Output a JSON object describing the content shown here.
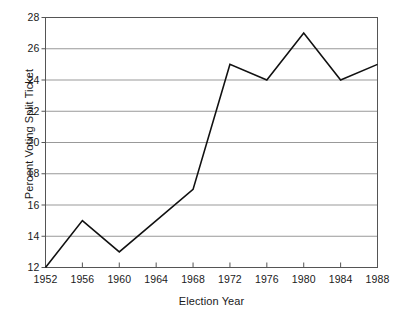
{
  "chart_data": {
    "type": "line",
    "title": "",
    "xlabel": "Election Year",
    "ylabel": "Percent Voting Split Ticket",
    "x": [
      1952,
      1956,
      1960,
      1964,
      1968,
      1972,
      1976,
      1980,
      1984,
      1988
    ],
    "values": [
      12,
      15,
      13,
      15,
      17,
      25,
      24,
      27,
      24,
      25
    ],
    "series": [
      {
        "name": "Percent Voting Split Ticket",
        "values": [
          12,
          15,
          13,
          15,
          17,
          25,
          24,
          27,
          24,
          25
        ]
      }
    ],
    "xlim": [
      1952,
      1988
    ],
    "ylim": [
      12,
      28
    ],
    "xticks": [
      1952,
      1956,
      1960,
      1964,
      1968,
      1972,
      1976,
      1980,
      1984,
      1988
    ],
    "yticks": [
      12,
      14,
      16,
      18,
      20,
      22,
      24,
      26,
      28
    ],
    "xtick_labels": [
      "1952",
      "1956",
      "1960",
      "1964",
      "1968",
      "1972",
      "1976",
      "1980",
      "1984",
      "1988"
    ],
    "ytick_labels": [
      "12",
      "14",
      "16",
      "18",
      "20",
      "22",
      "24",
      "26",
      "28"
    ],
    "grid": "horizontal",
    "legend": "none",
    "line_color": "#111111",
    "grid_color": "#999999",
    "axis_color": "#555555",
    "background_color": "#ffffff",
    "markers": "none",
    "annotations": []
  }
}
